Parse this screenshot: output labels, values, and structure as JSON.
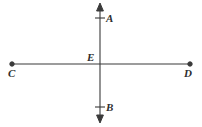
{
  "figure": {
    "type": "geometry-diagram",
    "width": 202,
    "height": 127,
    "background_color": "#ffffff",
    "stroke_color": "#3a3a3a",
    "labels": {
      "a": "A",
      "b": "B",
      "c": "C",
      "d": "D",
      "e": "E"
    },
    "elements": {
      "vertical_line": {
        "x": 100,
        "y_top": 4,
        "y_bottom": 122,
        "arrow_top": true,
        "arrow_bottom": true
      },
      "horizontal_line": {
        "y": 64,
        "x_left": 12,
        "x_right": 190,
        "endpoint_dot_left": true,
        "endpoint_dot_right": true
      },
      "tick_marks": [
        {
          "name": "tick-a",
          "x": 100,
          "y": 18,
          "half_width": 5
        },
        {
          "name": "tick-b",
          "x": 100,
          "y": 107,
          "half_width": 5
        }
      ],
      "intersection": {
        "x": 100,
        "y": 64
      }
    }
  }
}
